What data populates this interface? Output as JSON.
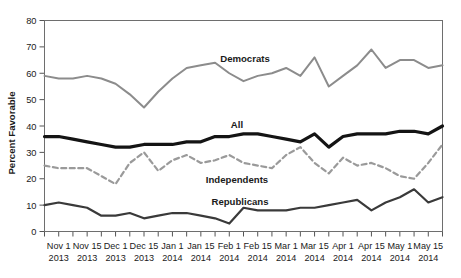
{
  "chart_data": {
    "type": "line",
    "title": "",
    "xlabel": "",
    "ylabel": "Percent Favorable",
    "ylim": [
      0,
      80
    ],
    "ytick_step": 10,
    "yticks": [
      "0",
      "10",
      "20",
      "30",
      "40",
      "50",
      "60",
      "70",
      "80"
    ],
    "grid": false,
    "legend_position": "inline-annotations",
    "x": [
      "Oct 25 2013",
      "Nov 1 2013",
      "Nov 8 2013",
      "Nov 15 2013",
      "Nov 22 2013",
      "Dec 1 2013",
      "Dec 8 2013",
      "Dec 15 2013",
      "Dec 22 2013",
      "Jan 1 2014",
      "Jan 8 2014",
      "Jan 15 2014",
      "Jan 22 2014",
      "Feb 1 2014",
      "Feb 8 2014",
      "Feb 15 2014",
      "Feb 22 2014",
      "Mar 1 2014",
      "Mar 8 2014",
      "Mar 15 2014",
      "Mar 22 2014",
      "Apr 1 2014",
      "Apr 8 2014",
      "Apr 15 2014",
      "Apr 22 2014",
      "May 1 2014",
      "May 8 2014",
      "May 15 2014",
      "May 22 2014"
    ],
    "xtick_labels": [
      {
        "line1": "Nov 1",
        "line2": "2013"
      },
      {
        "line1": "Nov 15",
        "line2": "2013"
      },
      {
        "line1": "Dec 1",
        "line2": "2013"
      },
      {
        "line1": "Dec 15",
        "line2": "2013"
      },
      {
        "line1": "Jan 1",
        "line2": "2014"
      },
      {
        "line1": "Jan 15",
        "line2": "2014"
      },
      {
        "line1": "Feb 1",
        "line2": "2014"
      },
      {
        "line1": "Feb 15",
        "line2": "2014"
      },
      {
        "line1": "Mar 1",
        "line2": "2014"
      },
      {
        "line1": "Mar 15",
        "line2": "2014"
      },
      {
        "line1": "Apr 1",
        "line2": "2014"
      },
      {
        "line1": "Apr 15",
        "line2": "2014"
      },
      {
        "line1": "May 1",
        "line2": "2014"
      },
      {
        "line1": "May 15",
        "line2": "2014"
      }
    ],
    "series": [
      {
        "name": "Democrats",
        "color": "#8c8c8c",
        "style": "solid",
        "width": 2.0,
        "label_x": 245,
        "label_y": 62,
        "values": [
          59,
          58,
          58,
          59,
          58,
          56,
          52,
          47,
          53,
          58,
          62,
          63,
          64,
          60,
          57,
          59,
          60,
          62,
          59,
          66,
          55,
          59,
          63,
          69,
          62,
          65,
          65,
          62,
          63
        ]
      },
      {
        "name": "All",
        "color": "#141414",
        "style": "solid",
        "width": 3.2,
        "label_x": 237,
        "label_y": 128,
        "values": [
          36,
          36,
          35,
          34,
          33,
          32,
          32,
          33,
          33,
          33,
          34,
          34,
          36,
          36,
          37,
          37,
          36,
          35,
          34,
          37,
          32,
          36,
          37,
          37,
          37,
          38,
          38,
          37,
          40
        ]
      },
      {
        "name": "Independents",
        "color": "#9a9a9a",
        "style": "dashed",
        "width": 2.2,
        "label_x": 237,
        "label_y": 183,
        "values": [
          25,
          24,
          24,
          24,
          21,
          18,
          26,
          30,
          23,
          27,
          29,
          26,
          27,
          29,
          26,
          25,
          24,
          29,
          32,
          26,
          22,
          28,
          25,
          26,
          24,
          21,
          20,
          26,
          33
        ]
      },
      {
        "name": "Republicans",
        "color": "#3a3a3a",
        "style": "solid",
        "width": 2.2,
        "label_x": 240,
        "label_y": 205,
        "values": [
          10,
          11,
          10,
          9,
          6,
          6,
          7,
          5,
          6,
          7,
          7,
          6,
          5,
          3,
          9,
          8,
          8,
          8,
          9,
          9,
          10,
          11,
          12,
          8,
          11,
          13,
          16,
          11,
          13
        ]
      }
    ]
  }
}
